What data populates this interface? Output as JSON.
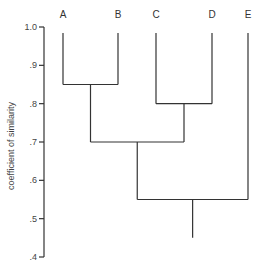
{
  "chart_data": {
    "type": "dendrogram",
    "title": "",
    "ylabel": "coefficient of similarity",
    "xlabel": "",
    "ylim": [
      0.4,
      1.0
    ],
    "yticks": [
      {
        "value": 1.0,
        "label": "1.0"
      },
      {
        "value": 0.9,
        "label": ".9"
      },
      {
        "value": 0.8,
        "label": ".8"
      },
      {
        "value": 0.7,
        "label": ".7"
      },
      {
        "value": 0.6,
        "label": ".6"
      },
      {
        "value": 0.5,
        "label": ".5"
      },
      {
        "value": 0.4,
        "label": ".4"
      }
    ],
    "leaves": [
      "A",
      "B",
      "C",
      "D",
      "E"
    ],
    "merges": [
      {
        "clusters": [
          "A",
          "B"
        ],
        "similarity": 0.85
      },
      {
        "clusters": [
          "C",
          "D"
        ],
        "similarity": 0.8
      },
      {
        "clusters": [
          "A-B",
          "C-D"
        ],
        "similarity": 0.7
      },
      {
        "clusters": [
          "A-B-C-D",
          "E"
        ],
        "similarity": 0.55
      }
    ],
    "root_stem_to": 0.45,
    "grid": false
  },
  "colors": {
    "line": "#333333",
    "text": "#444444",
    "background": "#ffffff"
  }
}
